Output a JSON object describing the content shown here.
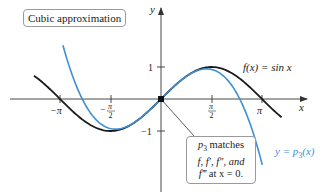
{
  "chart_data": {
    "type": "line",
    "title": "Cubic approximation",
    "xlabel": "x",
    "ylabel": "y",
    "x_ticks": [
      {
        "label": "−π",
        "value": -3.14159
      },
      {
        "label": "−π/2",
        "value": -1.5708
      },
      {
        "label": "π/2",
        "value": 1.5708
      },
      {
        "label": "π",
        "value": 3.14159
      }
    ],
    "y_ticks": [
      {
        "label": "1",
        "value": 1
      },
      {
        "label": "−1",
        "value": -1
      }
    ],
    "xlim": [
      -3.9,
      4.4
    ],
    "ylim": [
      -1.9,
      2.9
    ],
    "grid": false,
    "series": [
      {
        "name": "f(x) = sin x",
        "label": "f(x) = sin x",
        "expression": "sin(x)",
        "color": "#1a1a1a",
        "domain": [
          -3.95,
          3.75
        ]
      },
      {
        "name": "y = p3(x)",
        "label": "y = p₃(x)",
        "expression": "x - x^3/6",
        "color": "#3d8fd6",
        "domain": [
          -3.05,
          3.15
        ]
      }
    ],
    "highlight_point": {
      "x": 0,
      "y": 0
    },
    "annotations": [
      {
        "text": "p₃ matches f, f′, f″, and f‴ at x = 0.",
        "points_to": [
          0,
          0
        ]
      }
    ]
  },
  "labels": {
    "title": "Cubic approximation",
    "sin_label": "f(x) = sin x",
    "blue_label_pre": "y = p",
    "blue_label_sub": "3",
    "blue_label_post": "(x)",
    "note_line1_p": "p",
    "note_line1_sub": "3",
    "note_line1_rest": " matches",
    "note_line2": "f, f′, f″, and",
    "note_line3_f": "f‴",
    "note_line3_rest": " at x = 0.",
    "x_axis": "x",
    "y_axis": "y"
  },
  "colors": {
    "sin": "#1a1a1a",
    "cubic": "#3d8fd6",
    "axis": "#333333"
  }
}
